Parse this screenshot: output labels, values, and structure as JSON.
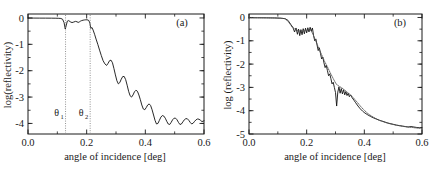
{
  "figure": {
    "panels": [
      "a",
      "b"
    ]
  },
  "panel_a": {
    "tag": "(a)",
    "xlabel": "angle of incidence [deg]",
    "ylabel": "log(reflectivity)",
    "xticklabels": [
      "0.0",
      "0.2",
      "0.4",
      "0.6"
    ],
    "yticklabels": [
      "0",
      "-1",
      "-2",
      "-3",
      "-4"
    ],
    "annotations": {
      "theta1": "θ",
      "theta1_sub": "1",
      "theta2": "θ",
      "theta2_sub": "2",
      "theta1_value": 0.128,
      "theta2_value": 0.212
    }
  },
  "panel_b": {
    "tag": "(b)",
    "xlabel": "angle of incidence [deg]",
    "ylabel": "log (reflectivity)",
    "xticklabels": [
      "0.0",
      "0.2",
      "0.4",
      "0.6"
    ],
    "yticklabels": [
      "0",
      "-1",
      "-2",
      "-3",
      "-4",
      "-5"
    ]
  },
  "chart_data": [
    {
      "type": "line",
      "title": "(a)",
      "xlabel": "angle of incidence [deg]",
      "ylabel": "log(reflectivity)",
      "xlim": [
        0.0,
        0.6
      ],
      "ylim": [
        -4.4,
        0.15
      ],
      "xticks": [
        0.0,
        0.2,
        0.4,
        0.6
      ],
      "yticks": [
        0,
        -1,
        -2,
        -3,
        -4
      ],
      "grid": false,
      "legend": "none",
      "annotations": [
        {
          "text": "theta_1",
          "x": 0.128,
          "type": "vertical-dotted-line",
          "label_y": -3.72
        },
        {
          "text": "theta_2",
          "x": 0.212,
          "type": "vertical-dotted-line",
          "label_y": -3.72
        }
      ],
      "series": [
        {
          "name": "reflectivity",
          "style": "solid",
          "x": [
            0.0,
            0.02,
            0.04,
            0.06,
            0.08,
            0.095,
            0.105,
            0.112,
            0.118,
            0.123,
            0.127,
            0.13,
            0.134,
            0.139,
            0.144,
            0.15,
            0.156,
            0.162,
            0.167,
            0.171,
            0.175,
            0.179,
            0.183,
            0.188,
            0.193,
            0.197,
            0.201,
            0.205,
            0.208,
            0.211,
            0.214,
            0.218,
            0.222,
            0.227,
            0.232,
            0.238,
            0.244,
            0.25,
            0.256,
            0.262,
            0.268,
            0.273,
            0.278,
            0.283,
            0.288,
            0.293,
            0.298,
            0.303,
            0.308,
            0.313,
            0.318,
            0.323,
            0.328,
            0.333,
            0.338,
            0.343,
            0.348,
            0.353,
            0.358,
            0.363,
            0.368,
            0.373,
            0.378,
            0.383,
            0.388,
            0.393,
            0.398,
            0.403,
            0.408,
            0.413,
            0.418,
            0.423,
            0.428,
            0.433,
            0.438,
            0.443,
            0.448,
            0.453,
            0.458,
            0.463,
            0.468,
            0.473,
            0.478,
            0.483,
            0.488,
            0.493,
            0.498,
            0.503,
            0.508,
            0.513,
            0.518,
            0.523,
            0.528,
            0.533,
            0.538,
            0.543,
            0.548,
            0.553,
            0.558,
            0.563,
            0.568,
            0.573,
            0.578,
            0.583,
            0.588,
            0.593,
            0.6
          ],
          "y": [
            -0.005,
            -0.005,
            -0.006,
            -0.007,
            -0.008,
            -0.01,
            -0.013,
            -0.02,
            -0.05,
            -0.18,
            -0.42,
            -0.3,
            -0.12,
            -0.1,
            -0.145,
            -0.175,
            -0.155,
            -0.13,
            -0.145,
            -0.17,
            -0.15,
            -0.12,
            -0.1,
            -0.085,
            -0.075,
            -0.07,
            -0.07,
            -0.08,
            -0.11,
            -0.2,
            -0.4,
            -0.36,
            -0.46,
            -0.62,
            -0.8,
            -1.0,
            -1.22,
            -1.43,
            -1.62,
            -1.74,
            -1.8,
            -1.72,
            -1.62,
            -1.6,
            -1.7,
            -1.92,
            -2.16,
            -2.38,
            -2.5,
            -2.45,
            -2.32,
            -2.22,
            -2.22,
            -2.34,
            -2.55,
            -2.78,
            -2.95,
            -3.0,
            -2.92,
            -2.8,
            -2.74,
            -2.78,
            -2.92,
            -3.1,
            -3.3,
            -3.45,
            -3.48,
            -3.4,
            -3.3,
            -3.26,
            -3.32,
            -3.48,
            -3.68,
            -3.88,
            -4.02,
            -4.0,
            -3.88,
            -3.76,
            -3.7,
            -3.72,
            -3.8,
            -3.92,
            -4.02,
            -4.04,
            -3.96,
            -3.86,
            -3.8,
            -3.8,
            -3.86,
            -3.96,
            -4.04,
            -4.02,
            -3.94,
            -3.86,
            -3.82,
            -3.82,
            -3.88,
            -3.96,
            -4.02,
            -3.99,
            -3.92,
            -3.86,
            -3.83,
            -3.84,
            -3.88,
            -3.93,
            -3.9
          ]
        }
      ]
    },
    {
      "type": "line",
      "title": "(b)",
      "xlabel": "angle of incidence [deg]",
      "ylabel": "log (reflectivity)",
      "xlim": [
        0.0,
        0.6
      ],
      "ylim": [
        -5.0,
        0.15
      ],
      "xticks": [
        0.0,
        0.2,
        0.4,
        0.6
      ],
      "yticks": [
        0,
        -1,
        -2,
        -3,
        -4,
        -5
      ],
      "grid": false,
      "legend": "none",
      "series": [
        {
          "name": "measured",
          "style": "solid",
          "x": [
            0.0,
            0.03,
            0.06,
            0.09,
            0.11,
            0.125,
            0.135,
            0.145,
            0.152,
            0.158,
            0.163,
            0.168,
            0.172,
            0.176,
            0.18,
            0.184,
            0.188,
            0.192,
            0.196,
            0.2,
            0.204,
            0.208,
            0.212,
            0.216,
            0.22,
            0.224,
            0.228,
            0.232,
            0.236,
            0.24,
            0.244,
            0.248,
            0.252,
            0.256,
            0.26,
            0.264,
            0.268,
            0.272,
            0.276,
            0.28,
            0.284,
            0.288,
            0.292,
            0.296,
            0.3,
            0.304,
            0.308,
            0.312,
            0.316,
            0.32,
            0.324,
            0.328,
            0.332,
            0.336,
            0.34,
            0.344,
            0.348,
            0.352,
            0.358,
            0.364,
            0.37,
            0.378,
            0.386,
            0.394,
            0.402,
            0.412,
            0.422,
            0.432,
            0.442,
            0.452,
            0.462,
            0.472,
            0.482,
            0.492,
            0.502,
            0.512,
            0.522,
            0.532,
            0.542,
            0.552,
            0.562,
            0.572,
            0.582,
            0.592,
            0.6
          ],
          "y": [
            -0.01,
            -0.012,
            -0.015,
            -0.02,
            -0.03,
            -0.05,
            -0.12,
            -0.3,
            -0.42,
            -0.62,
            -0.45,
            -0.72,
            -0.5,
            -0.78,
            -0.52,
            -0.74,
            -0.48,
            -0.7,
            -0.46,
            -0.66,
            -0.44,
            -0.62,
            -0.42,
            -0.58,
            -0.45,
            -0.78,
            -1.0,
            -0.92,
            -1.18,
            -1.42,
            -1.3,
            -1.55,
            -1.78,
            -1.7,
            -1.95,
            -2.15,
            -2.05,
            -2.28,
            -2.5,
            -2.42,
            -2.62,
            -2.85,
            -2.78,
            -3.0,
            -3.22,
            -3.8,
            -3.2,
            -2.98,
            -3.25,
            -3.05,
            -3.28,
            -3.1,
            -3.32,
            -3.18,
            -3.35,
            -3.25,
            -3.4,
            -3.32,
            -3.45,
            -3.55,
            -3.66,
            -3.8,
            -3.92,
            -4.02,
            -4.1,
            -4.18,
            -4.25,
            -4.31,
            -4.36,
            -4.41,
            -4.45,
            -4.49,
            -4.53,
            -4.56,
            -4.59,
            -4.62,
            -4.64,
            -4.66,
            -4.68,
            -4.7,
            -4.68,
            -4.7,
            -4.72,
            -4.73,
            -4.72
          ]
        },
        {
          "name": "fit",
          "style": "dotted",
          "x": [
            0.0,
            0.03,
            0.06,
            0.09,
            0.11,
            0.125,
            0.138,
            0.15,
            0.162,
            0.175,
            0.188,
            0.2,
            0.212,
            0.222,
            0.232,
            0.242,
            0.252,
            0.262,
            0.272,
            0.282,
            0.292,
            0.302,
            0.312,
            0.322,
            0.332,
            0.342,
            0.352,
            0.362,
            0.374,
            0.386,
            0.398,
            0.412,
            0.426,
            0.44,
            0.454,
            0.468,
            0.482,
            0.496,
            0.51,
            0.524,
            0.538,
            0.552,
            0.566,
            0.58,
            0.6
          ],
          "y": [
            -0.01,
            -0.012,
            -0.015,
            -0.02,
            -0.03,
            -0.05,
            -0.2,
            -0.42,
            -0.52,
            -0.58,
            -0.56,
            -0.55,
            -0.5,
            -0.72,
            -1.02,
            -1.32,
            -1.6,
            -1.88,
            -2.12,
            -2.38,
            -2.62,
            -2.85,
            -2.95,
            -3.02,
            -3.12,
            -3.22,
            -3.32,
            -3.45,
            -3.62,
            -3.8,
            -3.96,
            -4.12,
            -4.24,
            -4.34,
            -4.42,
            -4.48,
            -4.54,
            -4.58,
            -4.62,
            -4.65,
            -4.68,
            -4.7,
            -4.72,
            -4.74,
            -4.76
          ]
        }
      ]
    }
  ]
}
